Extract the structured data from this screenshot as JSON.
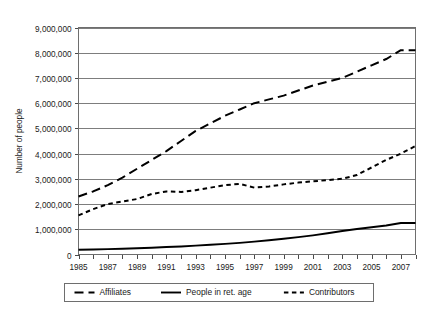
{
  "chart_data": {
    "type": "line",
    "title": "",
    "subtitle": "",
    "xlabel": "",
    "ylabel": "Number of people",
    "xlim": [
      1985,
      2008
    ],
    "ylim": [
      0,
      9000000
    ],
    "grid": true,
    "grid_axis": "y",
    "legend_position": "bottom",
    "x": [
      1985,
      1986,
      1987,
      1988,
      1989,
      1990,
      1991,
      1992,
      1993,
      1994,
      1995,
      1996,
      1997,
      1998,
      1999,
      2000,
      2001,
      2002,
      2003,
      2004,
      2005,
      2006,
      2007,
      2008
    ],
    "y_tick_labels": [
      "0",
      "1,000,000",
      "2,000,000",
      "3,000,000",
      "4,000,000",
      "5,000,000",
      "6,000,000",
      "7,000,000",
      "8,000,000",
      "9,000,000"
    ],
    "y_tick_values": [
      0,
      1000000,
      2000000,
      3000000,
      4000000,
      5000000,
      6000000,
      7000000,
      8000000,
      9000000
    ],
    "x_tick_labels": [
      "1985",
      "1987",
      "1989",
      "1991",
      "1993",
      "1995",
      "1997",
      "1999",
      "2001",
      "2003",
      "2005",
      "2007"
    ],
    "x_tick_values": [
      1985,
      1987,
      1989,
      1991,
      1993,
      1995,
      1997,
      1999,
      2001,
      2003,
      2005,
      2007
    ],
    "series": [
      {
        "name": "Affiliates",
        "style": "long-dash",
        "color": "#000000",
        "values": [
          2300000,
          2500000,
          2750000,
          3050000,
          3400000,
          3750000,
          4100000,
          4500000,
          4900000,
          5200000,
          5500000,
          5750000,
          6000000,
          6150000,
          6300000,
          6500000,
          6700000,
          6850000,
          7000000,
          7250000,
          7500000,
          7750000,
          8100000,
          8100000
        ]
      },
      {
        "name": "People in ret. age",
        "style": "solid",
        "color": "#000000",
        "values": [
          190000,
          200000,
          215000,
          230000,
          250000,
          270000,
          295000,
          320000,
          350000,
          385000,
          420000,
          460000,
          510000,
          565000,
          625000,
          690000,
          760000,
          840000,
          930000,
          1010000,
          1080000,
          1150000,
          1250000,
          1250000
        ]
      },
      {
        "name": "Contributors",
        "style": "short-dash",
        "color": "#000000",
        "values": [
          1550000,
          1800000,
          2000000,
          2100000,
          2200000,
          2400000,
          2500000,
          2480000,
          2550000,
          2650000,
          2750000,
          2800000,
          2650000,
          2700000,
          2780000,
          2850000,
          2900000,
          2950000,
          3000000,
          3150000,
          3450000,
          3750000,
          4000000,
          4300000
        ]
      }
    ]
  },
  "legend": {
    "items": [
      {
        "label": "Affiliates",
        "style": "long-dash"
      },
      {
        "label": "People in ret. age",
        "style": "solid"
      },
      {
        "label": "Contributors",
        "style": "short-dash"
      }
    ]
  }
}
